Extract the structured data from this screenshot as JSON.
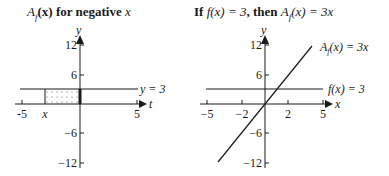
{
  "panels": [
    {
      "title_fn": "A",
      "title_sub": "f",
      "title_rest": "(x) for negative ",
      "title_var": "x",
      "y_label": "y",
      "x_label": "t",
      "y_ticks": [
        "12",
        "6",
        "−6",
        "−12"
      ],
      "x_ticks": [
        "-5",
        "x",
        "5"
      ],
      "line_label": "y = 3"
    },
    {
      "title_pre": "If ",
      "title_cond": "f(x) = 3",
      "title_mid": ", then ",
      "title_res": "A",
      "title_sub": "f",
      "title_res2": "(x) = 3x",
      "y_label": "y",
      "x_label": "x",
      "y_ticks": [
        "12",
        "6",
        "−6",
        "−12"
      ],
      "x_ticks": [
        "−5",
        "−2",
        "2",
        "5"
      ],
      "line1_label": "A",
      "line1_sub": "f",
      "line1_rest": "(x) = 3x",
      "line2_label": "f(x) = 3"
    }
  ]
}
